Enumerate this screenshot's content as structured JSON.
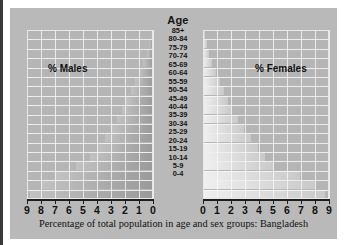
{
  "figure": {
    "age_axis_title": "Age",
    "males_label": "% Males",
    "females_label": "% Females",
    "caption": "Percentage of total population in age and sex groups: Bangladesh"
  },
  "colors": {
    "panel_background": "#b9b9b9",
    "plot_background": "#b5b5b5",
    "gridline": "#f2f2f2",
    "male_bar": "#a8a8a8",
    "female_bar": "#dcdcdc",
    "axis": "#1d1d1d",
    "text": "#111111"
  },
  "chart_data": {
    "type": "bar",
    "title": "Percentage of total population in age and sex groups: Bangladesh",
    "subtitle": "",
    "orientation": "horizontal",
    "layout": "population-pyramid",
    "xlabel": "Percentage of total population",
    "ylabel": "Age",
    "grid": true,
    "legend_position": "in-plot",
    "categories": [
      "85+",
      "80-84",
      "75-79",
      "70-74",
      "65-69",
      "60-64",
      "55-59",
      "50-54",
      "45-49",
      "40-44",
      "35-39",
      "30-34",
      "25-29",
      "20-24",
      "15-19",
      "10-14",
      "5-9",
      "0-4"
    ],
    "left_axis": {
      "name": "% Males",
      "ticks": [
        "9",
        "8",
        "7",
        "6",
        "5",
        "4",
        "3",
        "2",
        "1",
        "0"
      ],
      "xlim": [
        9,
        0
      ],
      "direction": "right-to-left"
    },
    "right_axis": {
      "name": "% Females",
      "ticks": [
        "0",
        "1",
        "2",
        "3",
        "4",
        "5",
        "6",
        "7",
        "8",
        "9"
      ],
      "xlim": [
        0,
        9
      ],
      "direction": "left-to-right"
    },
    "series": [
      {
        "name": "% Males",
        "side": "left",
        "values": [
          0.15,
          0.3,
          0.45,
          0.7,
          1.0,
          1.3,
          1.6,
          1.9,
          2.2,
          2.6,
          3.0,
          3.4,
          4.0,
          4.5,
          5.5,
          7.0,
          8.0,
          8.8
        ]
      },
      {
        "name": "% Females",
        "side": "right",
        "values": [
          0.15,
          0.3,
          0.45,
          0.65,
          0.9,
          1.2,
          1.5,
          1.8,
          2.1,
          2.5,
          2.9,
          3.4,
          3.9,
          4.4,
          5.1,
          6.9,
          8.1,
          8.7
        ]
      }
    ]
  }
}
